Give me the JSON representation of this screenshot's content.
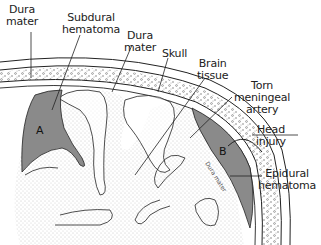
{
  "diagram": {
    "type": "anatomical cross-section",
    "labels": {
      "dura_mater_left": "Dura\nmater",
      "subdural_hematoma": "Subdural\nhematoma",
      "dura_mater_center": "Dura\nmater",
      "skull": "Skull",
      "brain_tissue": "Brain\ntissue",
      "torn_meningeal_artery": "Torn\nmeningeal\nartery",
      "head_injury": "Head\ninjury",
      "epidural_hematoma": "Epidural\nhematoma",
      "dura_mater_inside_b": "Dura mater"
    },
    "regions": {
      "a": "A",
      "b": "B"
    },
    "colors": {
      "hematoma": "#8a8a8a",
      "outline": "#222222",
      "background": "#ffffff",
      "stipple": "#9a9a9a"
    }
  }
}
